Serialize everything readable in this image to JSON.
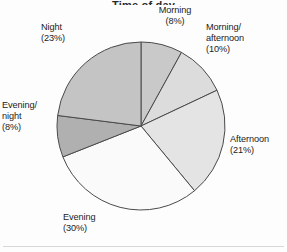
{
  "figure": {
    "title_partial": "Time of day",
    "background_color": "#fdfdfd",
    "rule_color": "#d8d8d8"
  },
  "chart_data": {
    "type": "pie",
    "title": "Time of day",
    "xlabel": "",
    "ylabel": "",
    "legend_position": "none",
    "grid": false,
    "start_angle_deg": 0,
    "direction": "clockwise",
    "center": {
      "x": 141,
      "y": 126
    },
    "radius": 84,
    "total_percent": 100,
    "categories": [
      "Morning",
      "Morning/afternoon",
      "Afternoon",
      "Evening",
      "Evening/night",
      "Night"
    ],
    "values": [
      8,
      10,
      21,
      30,
      8,
      23
    ],
    "slices": [
      {
        "name": "Morning",
        "label_line1": "Morning",
        "label_line2": "(8%)",
        "value": 8,
        "fill": "#c9c9c9",
        "stroke": "#4a4a4a"
      },
      {
        "name": "Morning/afternoon",
        "label_line1": "Morning/",
        "label_line2": "afternoon",
        "label_line3": "(10%)",
        "value": 10,
        "fill": "#dcdcdc",
        "stroke": "#4a4a4a"
      },
      {
        "name": "Afternoon",
        "label_line1": "Afternoon",
        "label_line2": "(21%)",
        "value": 21,
        "fill": "#e4e4e4",
        "stroke": "#4a4a4a"
      },
      {
        "name": "Evening",
        "label_line1": "Evening",
        "label_line2": "(30%)",
        "value": 30,
        "fill": "#fafafa",
        "stroke": "#4a4a4a"
      },
      {
        "name": "Evening/night",
        "label_line1": "Evening/",
        "label_line2": "night",
        "label_line3": "(8%)",
        "value": 8,
        "fill": "#b0b0b0",
        "stroke": "#4a4a4a"
      },
      {
        "name": "Night",
        "label_line1": "Night",
        "label_line2": "(23%)",
        "value": 23,
        "fill": "#c4c4c4",
        "stroke": "#4a4a4a"
      }
    ]
  },
  "labels": {
    "morning": "Morning\n(8%)",
    "morning_afternoon": "Morning/\nafternoon\n(10%)",
    "afternoon": "Afternoon\n(21%)",
    "evening": "Evening\n(30%)",
    "evening_night": "Evening/\nnight\n(8%)",
    "night": "Night\n(23%)"
  }
}
